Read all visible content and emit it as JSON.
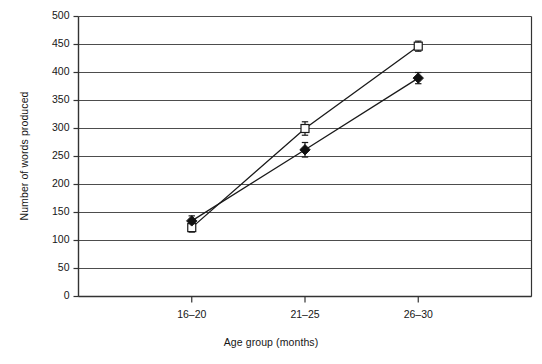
{
  "chart_data": {
    "type": "line",
    "title": "",
    "subtitle": "",
    "xlabel": "Age group (months)",
    "ylabel": "Number of words produced",
    "categories": [
      "16–20",
      "21–25",
      "26–30"
    ],
    "ylim": [
      0,
      500
    ],
    "ytick_step": 50,
    "yticks": [
      "0",
      "50",
      "100",
      "150",
      "200",
      "250",
      "300",
      "350",
      "400",
      "450",
      "500"
    ],
    "grid": "horizontal",
    "legend": "none",
    "series": [
      {
        "name": "open-square-series",
        "marker": "open-square",
        "values": [
          123,
          300,
          447
        ],
        "errors": [
          8,
          12,
          9
        ]
      },
      {
        "name": "filled-diamond-series",
        "marker": "filled-diamond",
        "values": [
          135,
          262,
          390
        ],
        "errors": [
          9,
          13,
          10
        ]
      }
    ]
  },
  "style": {
    "line_color": "#1a1a1a",
    "grid_color": "#4d4d4d",
    "axis_color": "#333333",
    "marker_fill_open": "#ffffff",
    "marker_fill_filled": "#111111",
    "background": "#ffffff"
  }
}
